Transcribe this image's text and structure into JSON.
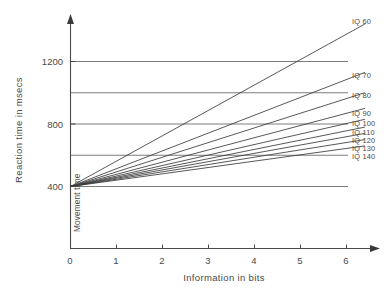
{
  "chart_data": {
    "type": "line",
    "title": "",
    "xlabel": "Information in bits",
    "ylabel": "Reaction time in msecs",
    "xlim": [
      0,
      6.9
    ],
    "ylim": [
      0,
      1400
    ],
    "grid": true,
    "legend_position": "right-of-plot-inline",
    "x_ticks": [
      "0",
      "1",
      "2",
      "3",
      "4",
      "5",
      "6"
    ],
    "x_tick_values": [
      0,
      1,
      2,
      3,
      4,
      5,
      6
    ],
    "y_ticks": [
      "400",
      "800",
      "1200"
    ],
    "y_tick_values": [
      400,
      800,
      1200
    ],
    "y_gridline_values": [
      400,
      600,
      800,
      1000,
      1200
    ],
    "x_data_range": [
      0,
      6.4
    ],
    "intercept": 400,
    "annotations": [
      {
        "text": "Movement time",
        "x": 0.12,
        "y": 160,
        "orientation": "vertical"
      }
    ],
    "series": [
      {
        "name": "IQ 60",
        "label": "IQ 60",
        "slope": 162.5,
        "intercept": 400,
        "values": [
          400,
          1440
        ]
      },
      {
        "name": "IQ 70",
        "label": "IQ 70",
        "slope": 114.1,
        "intercept": 400,
        "values": [
          400,
          1130
        ]
      },
      {
        "name": "IQ 80",
        "label": "IQ 80",
        "slope": 93.8,
        "intercept": 400,
        "values": [
          400,
          1000
        ]
      },
      {
        "name": "IQ 90",
        "label": "IQ 90",
        "slope": 78.1,
        "intercept": 400,
        "values": [
          400,
          900
        ]
      },
      {
        "name": "IQ 100",
        "label": "IQ 100",
        "slope": 67.2,
        "intercept": 400,
        "values": [
          400,
          830
        ]
      },
      {
        "name": "IQ 110",
        "label": "IQ 110",
        "slope": 59.4,
        "intercept": 400,
        "values": [
          400,
          780
        ]
      },
      {
        "name": "IQ 120",
        "label": "IQ 120",
        "slope": 53.1,
        "intercept": 400,
        "values": [
          400,
          740
        ]
      },
      {
        "name": "IQ 130",
        "label": "IQ 130",
        "slope": 46.9,
        "intercept": 400,
        "values": [
          400,
          700
        ]
      },
      {
        "name": "IQ 140",
        "label": "IQ 140",
        "slope": 40.6,
        "intercept": 400,
        "values": [
          400,
          660
        ]
      }
    ]
  },
  "labels": {
    "series_0": "IQ 60",
    "series_1": "IQ 70",
    "series_2": "IQ 80",
    "series_3": "IQ 90",
    "series_4": "IQ 100",
    "series_5": "IQ 110",
    "series_6": "IQ 120",
    "series_7": "IQ 130",
    "series_8": "IQ 140",
    "ytick_0": "400",
    "ytick_1": "800",
    "ytick_2": "1200",
    "xtick_0": "0",
    "xtick_1": "1",
    "xtick_2": "2",
    "xtick_3": "3",
    "xtick_4": "4",
    "xtick_5": "5",
    "xtick_6": "6",
    "xaxis_title": "Information in bits",
    "yaxis_title": "Reaction time in msecs",
    "movement_time": "Movement time"
  },
  "colors": {
    "line": "#3a3a3a",
    "grid": "#5a5a5a",
    "axis": "#4a4a4a",
    "background": "#ffffff"
  }
}
